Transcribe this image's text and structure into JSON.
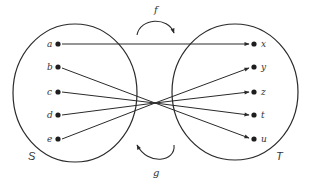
{
  "diagram": {
    "title": "",
    "sets": [
      {
        "name": "S",
        "elements": [
          "a",
          "b",
          "c",
          "d",
          "e"
        ]
      },
      {
        "name": "T",
        "elements": [
          "x",
          "y",
          "z",
          "t",
          "u"
        ]
      }
    ],
    "functions": [
      {
        "name": "f",
        "direction": "S to T",
        "position": "top"
      },
      {
        "name": "g",
        "direction": "T to S",
        "position": "bottom"
      }
    ],
    "mapping": [
      {
        "from": "a",
        "to": "x",
        "style": "straight"
      },
      {
        "from": "b",
        "to": "u",
        "style": "through-crossing"
      },
      {
        "from": "c",
        "to": "t",
        "style": "through-crossing"
      },
      {
        "from": "d",
        "to": "z",
        "style": "through-crossing"
      },
      {
        "from": "e",
        "to": "y",
        "style": "through-crossing"
      }
    ],
    "colors": {
      "stroke": "#2a2a2a",
      "background": "#ffffff"
    }
  },
  "labels": {
    "set_s": "S",
    "set_t": "T",
    "func_f": "f",
    "func_g": "g",
    "a": "a",
    "b": "b",
    "c": "c",
    "d": "d",
    "e": "e",
    "x": "x",
    "y": "y",
    "z": "z",
    "t": "t",
    "u": "u"
  }
}
